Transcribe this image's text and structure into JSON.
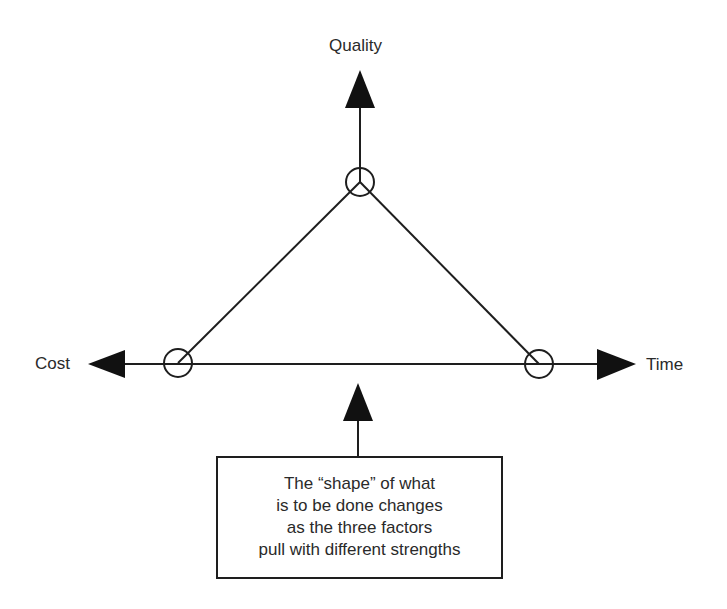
{
  "diagram": {
    "title": "",
    "type": "project management triangle",
    "nodes": [
      {
        "id": "quality",
        "label": "Quality",
        "position": "top"
      },
      {
        "id": "cost",
        "label": "Cost",
        "position": "left"
      },
      {
        "id": "time",
        "label": "Time",
        "position": "right"
      }
    ],
    "edges": [
      {
        "from": "quality",
        "to": "cost",
        "style": "line"
      },
      {
        "from": "quality",
        "to": "time",
        "style": "line"
      },
      {
        "from": "cost",
        "to": "time",
        "style": "line"
      }
    ],
    "pull_arrows": [
      {
        "direction": "up",
        "toward": "Quality"
      },
      {
        "direction": "left",
        "toward": "Cost"
      },
      {
        "direction": "right",
        "toward": "Time"
      }
    ],
    "note": {
      "lines": [
        "The “shape” of what",
        "is to be done changes",
        "as the three factors",
        "pull with different strengths"
      ],
      "points_to": "triangle base"
    },
    "colors": {
      "stroke": "#1e1e1e",
      "background": "#ffffff",
      "text": "#2a2a2a"
    }
  }
}
